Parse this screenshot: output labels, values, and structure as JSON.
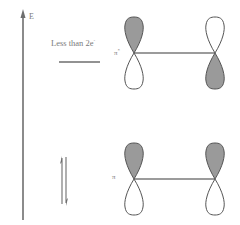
{
  "diagram": {
    "type": "molecular-orbital-energy-diagram",
    "axis": {
      "label": "E",
      "direction": "up"
    },
    "levels": [
      {
        "name": "pi-star",
        "label": "π*",
        "label_base": "π",
        "label_sup": "*",
        "annotation": "Less than 2e",
        "annotation_base": "Less than 2e",
        "annotation_sup": "-",
        "electron_count_shown": 0,
        "phases": {
          "left_atom": "shaded-top",
          "right_atom": "shaded-bottom"
        }
      },
      {
        "name": "pi",
        "label": "π",
        "electrons": "↑↓",
        "electron_count_shown": 2,
        "phases": {
          "left_atom": "shaded-top",
          "right_atom": "shaded-top"
        }
      }
    ],
    "colors": {
      "line": "#6e6e6e",
      "shaded_lobe": "#9a9a9a",
      "text": "#7a7a7a",
      "background": "#ffffff"
    }
  }
}
